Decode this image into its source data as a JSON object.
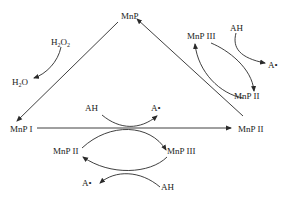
{
  "diagram": {
    "colors": {
      "stroke": "#2a2a2a",
      "text": "#222222",
      "background": "#ffffff"
    },
    "nodes": {
      "mnp": "MnP",
      "h2o2": {
        "base1": "H",
        "sub1": "2",
        "base2": "O",
        "sub2": "2"
      },
      "h2o": {
        "base1": "H",
        "sub1": "2",
        "base2": "O"
      },
      "mnp_iii_top": "MnP III",
      "ah_top": "AH",
      "a_radical_top": "A•",
      "mnp_ii_upper_right": "MnP II",
      "mnp_i": "MnP I",
      "mnp_ii_right": "MnP II",
      "ah_center": "AH",
      "a_radical_center": "A•",
      "mnp_ii_left": "MnP II",
      "mnp_iii_center": "MnP III",
      "a_radical_bottom": "A•",
      "ah_bottom": "AH"
    },
    "edges": [
      {
        "from": "MnP",
        "to": "MnP I",
        "label": "H2O2 → H2O"
      },
      {
        "from": "MnP I",
        "to": "MnP II",
        "label": "AH → A•"
      },
      {
        "from": "MnP II",
        "to": "MnP",
        "label": ""
      },
      {
        "from": "MnP III",
        "to": "MnP II",
        "label": "AH → A•"
      },
      {
        "from": "MnP II",
        "to": "MnP III",
        "label": ""
      },
      {
        "from": "MnP II (left)",
        "to": "MnP III (center)",
        "label": ""
      },
      {
        "from": "MnP III (center)",
        "to": "MnP II (left)",
        "label": "AH → A•"
      }
    ]
  }
}
